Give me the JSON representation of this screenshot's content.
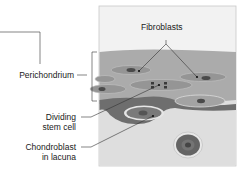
{
  "diagram": {
    "type": "histology illustration",
    "colors": {
      "panel_background": "#f2f2f2",
      "perichondrium_band": "#a9a9a9",
      "dark_layer": "#6e6e6e",
      "cartilage_matrix": "#dcdcdc",
      "cell_body": "#9a9a9a",
      "nucleus": "#4a4a4a",
      "leader_line": "#333333"
    }
  },
  "labels": {
    "fibroblasts": "Fibroblasts",
    "perichondrium": "Perichondrium",
    "dividing_stem_cell_line1": "Dividing",
    "dividing_stem_cell_line2": "stem cell",
    "chondroblast_line1": "Chondroblast",
    "chondroblast_line2": "in lacuna"
  }
}
